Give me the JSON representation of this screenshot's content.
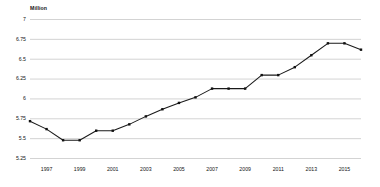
{
  "chart_data": {
    "type": "line",
    "title": "",
    "subtitle": "",
    "unit_label": "Million",
    "xlabel": "",
    "ylabel": "Million",
    "ylim": [
      5.25,
      7
    ],
    "xlim": [
      1996,
      2016
    ],
    "grid": true,
    "legend": "none",
    "y_ticks": [
      "7",
      "6.75",
      "6.5",
      "6.25",
      "6",
      "5.75",
      "5.5",
      "5.25"
    ],
    "y_tick_values": [
      7,
      6.75,
      6.5,
      6.25,
      6,
      5.75,
      5.5,
      5.25
    ],
    "x_ticks": [
      "1997",
      "1999",
      "2001",
      "2003",
      "2005",
      "2007",
      "2009",
      "2011",
      "2013",
      "2015"
    ],
    "x_tick_values": [
      1997,
      1999,
      2001,
      2003,
      2005,
      2007,
      2009,
      2011,
      2013,
      2015
    ],
    "x": [
      1996,
      1997,
      1998,
      1999,
      2000,
      2001,
      2002,
      2003,
      2004,
      2005,
      2006,
      2007,
      2008,
      2009,
      2010,
      2011,
      2012,
      2013,
      2014,
      2015,
      2016
    ],
    "values": [
      5.72,
      5.62,
      5.48,
      5.48,
      5.6,
      5.6,
      5.68,
      5.78,
      5.87,
      5.95,
      6.02,
      6.13,
      6.13,
      6.13,
      6.3,
      6.3,
      6.4,
      6.55,
      6.7,
      6.7,
      6.62
    ],
    "series": [
      {
        "name": "Million",
        "color": "#1a1a1a",
        "marker": "square",
        "values": [
          5.72,
          5.62,
          5.48,
          5.48,
          5.6,
          5.6,
          5.68,
          5.78,
          5.87,
          5.95,
          6.02,
          6.13,
          6.13,
          6.13,
          6.3,
          6.3,
          6.4,
          6.55,
          6.7,
          6.7,
          6.62
        ]
      }
    ],
    "colors": {
      "line": "#1a1a1a",
      "marker": "#111111",
      "grid": "#c8c8c8",
      "text": "#141414",
      "background": "#ffffff"
    }
  }
}
